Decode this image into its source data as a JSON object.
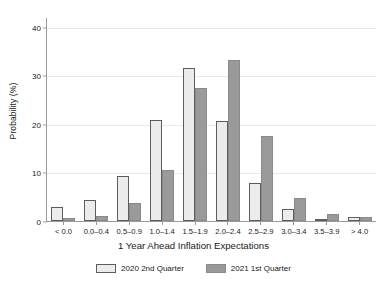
{
  "chart_data": {
    "type": "bar",
    "title": "",
    "xlabel": "1 Year Ahead Inflation Expectations",
    "ylabel": "Probability (%)",
    "categories": [
      "< 0.0",
      "0.0–0.4",
      "0.5–0.9",
      "1.0–1.4",
      "1.5–1.9",
      "2.0–2.4",
      "2.5–2.9",
      "3.0–3.4",
      "3.5–3.9",
      "> 4.0"
    ],
    "series": [
      {
        "name": "2020 2nd Quarter",
        "color": "#ececec",
        "edge_color": "#5d5d5d",
        "values": [
          2.9,
          4.3,
          9.3,
          20.7,
          31.5,
          20.5,
          7.8,
          2.5,
          0.5,
          0.9
        ]
      },
      {
        "name": "2021 1st Quarter",
        "color": "#9a9a9a",
        "edge_color": "#8a8a8a",
        "values": [
          0.6,
          1.0,
          3.8,
          10.6,
          27.3,
          33.1,
          17.6,
          4.7,
          1.4,
          0.9
        ]
      }
    ],
    "ylim": [
      0,
      42
    ],
    "yticks": [
      0,
      10,
      20,
      30,
      40
    ],
    "ytick_labels": [
      "0",
      "10",
      "20",
      "30",
      "40"
    ],
    "grid": true,
    "grid_axis": "y",
    "legend_position": "bottom-center"
  }
}
